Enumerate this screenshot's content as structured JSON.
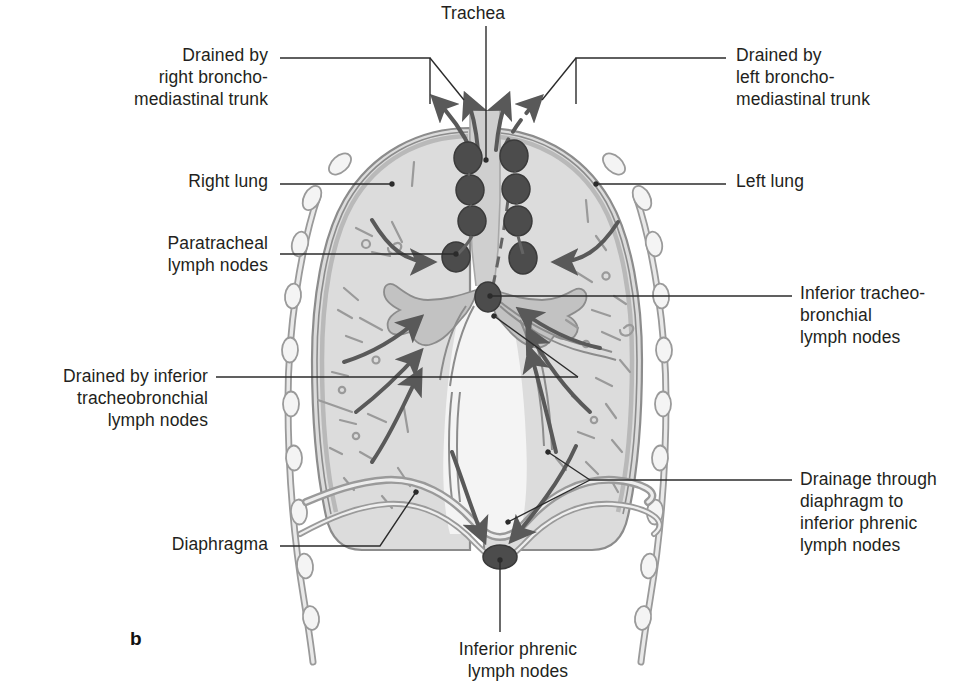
{
  "figure": {
    "panel_letter": "b",
    "title_implicit": "Lymphatic drainage of the lungs (coronal section)"
  },
  "colors": {
    "ink": "#231f20",
    "leader_line": "#2b2b2b",
    "lung_fill": "#dcdcdc",
    "lung_edge": "#8c8c8c",
    "pleura_fill": "#c9c9c9",
    "rib_fill": "#f2f2f2",
    "rib_edge": "#9a9a9a",
    "mediastinum_fill": "#e4e4e4",
    "trachea_fill": "#cfcfcf",
    "bronchus_fill": "#c2c2c2",
    "lymph_node": "#4c4c4c",
    "lymph_node_edge": "#3a3a3a",
    "vessel": "#636363",
    "arrow": "#595959",
    "background": "#ffffff"
  },
  "labels": [
    {
      "id": "trachea",
      "text": "Trachea",
      "align": "center",
      "x": 408,
      "y": 2,
      "w": 130
    },
    {
      "id": "drained-right-bronchomediastinal-trunk",
      "text": "Drained by\nright broncho-\nmediastinal trunk",
      "align": "right",
      "x": 20,
      "y": 44,
      "w": 248
    },
    {
      "id": "drained-left-bronchomediastinal-trunk",
      "text": "Drained by\nleft broncho-\nmediastinal trunk",
      "align": "left",
      "x": 736,
      "y": 44,
      "w": 240
    },
    {
      "id": "right-lung",
      "text": "Right lung",
      "align": "right",
      "x": 60,
      "y": 170,
      "w": 208
    },
    {
      "id": "left-lung",
      "text": "Left lung",
      "align": "left",
      "x": 736,
      "y": 170,
      "w": 180
    },
    {
      "id": "paratracheal-lymph-nodes",
      "text": "Paratracheal\nlymph nodes",
      "align": "right",
      "x": 40,
      "y": 232,
      "w": 228
    },
    {
      "id": "inferior-tracheobronchial-lymph-nodes",
      "text": "Inferior tracheo-\nbronchial\nlymph nodes",
      "align": "left",
      "x": 800,
      "y": 282,
      "w": 200
    },
    {
      "id": "drained-by-inferior-tracheobronchial-lymph-nodes",
      "text": "Drained by inferior\ntracheobronchial\nlymph nodes",
      "align": "right",
      "x": 0,
      "y": 365,
      "w": 208
    },
    {
      "id": "drainage-through-diaphragm",
      "text": "Drainage through\ndiaphragm to\ninferior phrenic\nlymph nodes",
      "align": "left",
      "x": 800,
      "y": 468,
      "w": 200
    },
    {
      "id": "diaphragma",
      "text": "Diaphragma",
      "align": "right",
      "x": 50,
      "y": 533,
      "w": 218
    },
    {
      "id": "inferior-phrenic-lymph-nodes",
      "text": "Inferior phrenic\nlymph nodes",
      "align": "center",
      "x": 418,
      "y": 638,
      "w": 200
    }
  ],
  "anatomy": {
    "structures": [
      "trachea",
      "right lung",
      "left lung",
      "main bronchi",
      "diaphragma",
      "pleura",
      "ribs",
      "pulmonary vessels"
    ],
    "lymph_node_groups": [
      {
        "name": "paratracheal lymph nodes",
        "count": 8,
        "side": "both"
      },
      {
        "name": "inferior tracheobronchial lymph nodes",
        "count": 1,
        "side": "midline"
      },
      {
        "name": "inferior phrenic lymph nodes",
        "count": 1,
        "side": "midline"
      }
    ],
    "drainage_arrows": [
      {
        "from": "right paratracheal chain",
        "to": "right bronchomediastinal trunk",
        "style": "solid"
      },
      {
        "from": "left paratracheal chain",
        "to": "left bronchomediastinal trunk",
        "style": "solid"
      },
      {
        "from": "left paratracheal chain",
        "to": "left bronchomediastinal trunk",
        "style": "dashed"
      },
      {
        "from": "right lung",
        "to": "right paratracheal lymph nodes",
        "style": "solid"
      },
      {
        "from": "left lung",
        "to": "left paratracheal lymph nodes",
        "style": "solid"
      },
      {
        "from": "right lower lung",
        "to": "inferior tracheobronchial lymph nodes",
        "style": "solid"
      },
      {
        "from": "left lower lung",
        "to": "inferior tracheobronchial lymph nodes",
        "style": "solid"
      },
      {
        "from": "through diaphragm",
        "to": "inferior phrenic lymph nodes",
        "style": "solid"
      }
    ]
  }
}
